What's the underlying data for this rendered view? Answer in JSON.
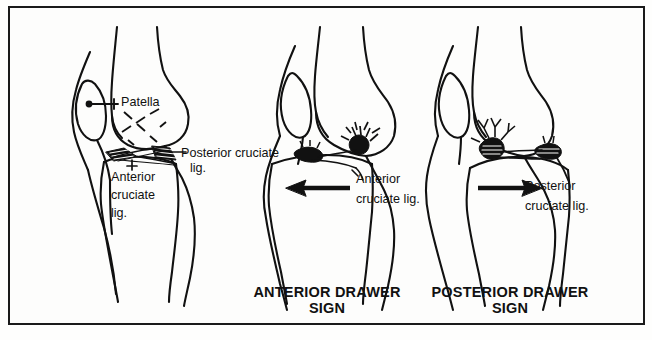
{
  "figure": {
    "kind": "anatomical-line-drawing",
    "panel_count": 3,
    "background_color": "#fdfdfc",
    "ink_color": "#111111",
    "frame_color": "#1a1a1a"
  },
  "captions": {
    "anterior_drawer_line1": "ANTERIOR DRAWER",
    "anterior_drawer_line2": "SIGN",
    "posterior_drawer_line1": "POSTERIOR DRAWER",
    "posterior_drawer_line2": "SIGN"
  },
  "panels": [
    {
      "id": "normal-knee",
      "caption": "",
      "labels": [
        {
          "id": "patella",
          "text": "Patella"
        },
        {
          "id": "posterior-cruciate-line1",
          "text": "Posterior cruciate"
        },
        {
          "id": "posterior-cruciate-line2",
          "text": "lig."
        },
        {
          "id": "anterior-cruciate-line1",
          "text": "Anterior"
        },
        {
          "id": "anterior-cruciate-line2",
          "text": "cruciate"
        },
        {
          "id": "anterior-cruciate-line3",
          "text": "lig."
        }
      ],
      "arrow": null
    },
    {
      "id": "anterior-drawer-knee",
      "caption": "ANTERIOR DRAWER SIGN",
      "labels": [
        {
          "id": "anterior-cruciate-line1",
          "text": "Anterior"
        },
        {
          "id": "anterior-cruciate-line2",
          "text": "cruciate lig."
        }
      ],
      "arrow": {
        "direction": "left",
        "meaning": "tibia-displaced-anteriorly"
      }
    },
    {
      "id": "posterior-drawer-knee",
      "caption": "POSTERIOR DRAWER SIGN",
      "labels": [
        {
          "id": "posterior-cruciate-line1",
          "text": "Posterior"
        },
        {
          "id": "posterior-cruciate-line2",
          "text": "cruciate lig."
        }
      ],
      "arrow": {
        "direction": "right",
        "meaning": "tibia-displaced-posteriorly"
      }
    }
  ],
  "labels": {
    "patella": "Patella",
    "k1_post_a": "Posterior cruciate",
    "k1_post_b": "lig.",
    "k1_ant_a": "Anterior",
    "k1_ant_b": "cruciate",
    "k1_ant_c": "lig.",
    "k2_ant_a": "Anterior",
    "k2_ant_b": "cruciate lig.",
    "k3_post_a": "Posterior",
    "k3_post_b": "cruciate lig."
  }
}
